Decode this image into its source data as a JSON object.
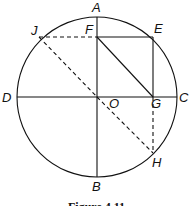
{
  "figure": {
    "caption": "Figure 4.11",
    "circle": {
      "cx": 97,
      "cy": 97,
      "r": 80
    },
    "points": {
      "A": {
        "label": "A",
        "x": 97,
        "y": 17
      },
      "B": {
        "label": "B",
        "x": 97,
        "y": 177
      },
      "C": {
        "label": "C",
        "x": 177,
        "y": 97
      },
      "D": {
        "label": "D",
        "x": 17,
        "y": 97
      },
      "O": {
        "label": "O",
        "x": 97,
        "y": 97
      },
      "E": {
        "label": "E",
        "x": 153,
        "y": 37
      },
      "F": {
        "label": "F",
        "x": 97,
        "y": 37
      },
      "G": {
        "label": "G",
        "x": 153,
        "y": 97
      },
      "H": {
        "label": "H",
        "x": 153,
        "y": 153
      },
      "J": {
        "label": "J",
        "x": 39,
        "y": 37
      }
    },
    "solid_segments": [
      "AB",
      "DC",
      "FE",
      "EG",
      "FG"
    ],
    "dashed_segments": [
      "JF",
      "JO",
      "OH",
      "GH"
    ]
  }
}
